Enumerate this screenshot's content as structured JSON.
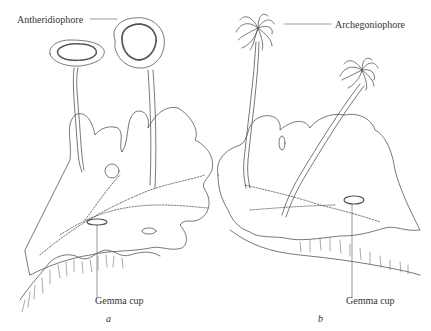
{
  "figure": {
    "panels": [
      {
        "id": "a",
        "label": "a",
        "labels": {
          "top": "Antheridiophore",
          "bottom": "Gemma cup"
        }
      },
      {
        "id": "b",
        "label": "b",
        "labels": {
          "top": "Archegoniophore",
          "bottom": "Gemma cup"
        }
      }
    ]
  },
  "colors": {
    "line": "#555555",
    "background": "#ffffff",
    "text": "#333333"
  }
}
